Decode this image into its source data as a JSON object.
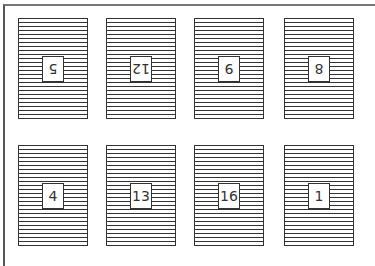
{
  "cards": [
    {
      "label": "5",
      "upside_down": true
    },
    {
      "label": "12",
      "upside_down": true
    },
    {
      "label": "9",
      "upside_down": true
    },
    {
      "label": "8",
      "upside_down": true
    },
    {
      "label": "4",
      "upside_down": false
    },
    {
      "label": "13",
      "upside_down": false
    },
    {
      "label": "16",
      "upside_down": false
    },
    {
      "label": "1",
      "upside_down": false
    }
  ]
}
